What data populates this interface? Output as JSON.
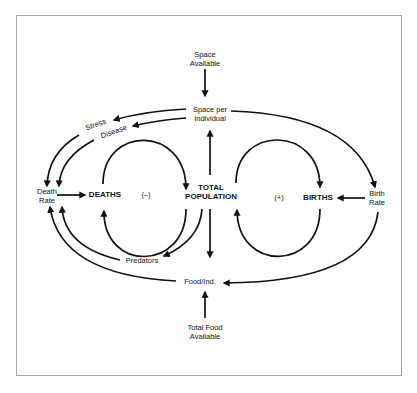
{
  "diagram": {
    "type": "causal-loop",
    "nodes": {
      "space_available": {
        "line1": "Space",
        "line2": "Available"
      },
      "space_per_individual": {
        "line1": "Space per",
        "line2": "Individual"
      },
      "stress": "Stress",
      "disease": "Disease",
      "death_rate": {
        "line1": "Death",
        "line2": "Rate"
      },
      "deaths": "DEATHS",
      "negative_loop": "(–)",
      "total_population": {
        "line1": "TOTAL",
        "line2": "POPULATION"
      },
      "positive_loop": "(+)",
      "births": "BIRTHS",
      "birth_rate": {
        "line1": "Birth",
        "line2": "Rate"
      },
      "predators": "Predators",
      "food_per_individual": "Food/Ind.",
      "total_food_available": {
        "line1": "Total Food",
        "line2": "Available"
      }
    },
    "edges": [
      {
        "from": "Space Available",
        "to": "Space per Individual"
      },
      {
        "from": "Space per Individual",
        "to": "Stress"
      },
      {
        "from": "Space per Individual",
        "to": "Disease"
      },
      {
        "from": "Space per Individual",
        "to": "Birth Rate"
      },
      {
        "from": "Stress",
        "to": "Death Rate"
      },
      {
        "from": "Disease",
        "to": "Death Rate"
      },
      {
        "from": "Death Rate",
        "to": "DEATHS"
      },
      {
        "from": "DEATHS",
        "to": "TOTAL POPULATION"
      },
      {
        "from": "TOTAL POPULATION",
        "to": "DEATHS"
      },
      {
        "from": "TOTAL POPULATION",
        "to": "Space per Individual"
      },
      {
        "from": "TOTAL POPULATION",
        "to": "Food/Ind."
      },
      {
        "from": "TOTAL POPULATION",
        "to": "Predators"
      },
      {
        "from": "TOTAL POPULATION",
        "to": "BIRTHS"
      },
      {
        "from": "BIRTHS",
        "to": "TOTAL POPULATION"
      },
      {
        "from": "Birth Rate",
        "to": "BIRTHS"
      },
      {
        "from": "Birth Rate",
        "to": "Food/Ind."
      },
      {
        "from": "Predators",
        "to": "Death Rate"
      },
      {
        "from": "Food/Ind.",
        "to": "Death Rate"
      },
      {
        "from": "Total Food Available",
        "to": "Food/Ind."
      }
    ],
    "colors": {
      "line": "#111111",
      "frame": "#a8a8a8",
      "background": "#ffffff"
    }
  }
}
